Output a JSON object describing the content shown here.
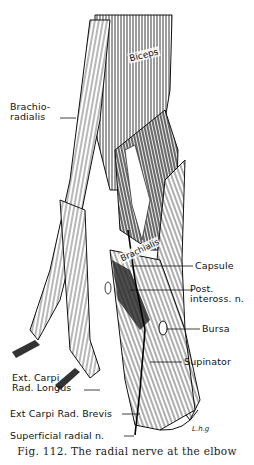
{
  "figure": {
    "caption": "Fig. 112. The radial nerve at the elbow",
    "artist_signature": "L.h.g",
    "labels": {
      "biceps": "Biceps",
      "brachioradialis": "Brachio-\nradialis",
      "brachialis": "Brachialis",
      "capsule": "Capsule",
      "post_inteross": "Post.\ninteross. n.",
      "bursa": "Bursa",
      "supinator": "Supinator",
      "ext_carpi_rad_longus": "Ext. Carpi\nRad. Longus",
      "ext_carpi_rad_brevis": "Ext Carpi Rad. Brevis",
      "superficial_radial_n": "Superficial radial n."
    }
  }
}
